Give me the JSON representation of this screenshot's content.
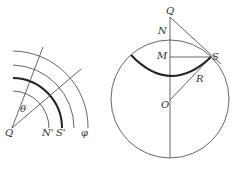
{
  "left_diagram": {
    "labels": {
      "center": "Q",
      "angle": "θ",
      "arc_inner": "N'",
      "arc_thick": "S'",
      "arc_outer": "φ"
    },
    "arc_count": 4,
    "ray_count": 2
  },
  "right_diagram": {
    "labels": {
      "top_point": "Q",
      "north": "N",
      "mid": "M",
      "tangent_point": "S",
      "radius": "R",
      "center": "O"
    },
    "elements": [
      "circle",
      "vertical-axis",
      "tangent-line-QS",
      "chord-MS",
      "radius-OS",
      "thick-arc"
    ]
  },
  "colors": {
    "line": "#555555",
    "thick_line": "#222222",
    "text": "#333333",
    "background": "#ffffff"
  }
}
